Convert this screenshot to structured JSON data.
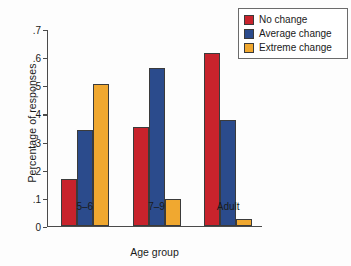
{
  "chart_data": {
    "type": "bar",
    "title": "",
    "xlabel": "Age group",
    "ylabel": "Percentage of responses",
    "categories": [
      "5–6",
      "7–9",
      "Adult"
    ],
    "series": [
      {
        "name": "No change",
        "color": "#C8232C",
        "values": [
          0.165,
          0.35,
          0.615
        ]
      },
      {
        "name": "Average change",
        "color": "#2B4B8C",
        "values": [
          0.34,
          0.56,
          0.375
        ]
      },
      {
        "name": "Extreme change",
        "color": "#F0A830",
        "values": [
          0.505,
          0.095,
          0.025
        ]
      }
    ],
    "ylim": [
      0,
      0.7
    ],
    "yticks": [
      0,
      0.1,
      0.2,
      0.3,
      0.4,
      0.5,
      0.6,
      0.7
    ],
    "ytick_labels": [
      "0",
      ".1",
      ".2",
      ".3",
      ".4",
      ".5",
      ".6",
      ".7"
    ],
    "grid": false,
    "legend_position": "top-right",
    "axis_color": "#4a4a4a",
    "bar_edge_color": "#3b3b3b"
  }
}
